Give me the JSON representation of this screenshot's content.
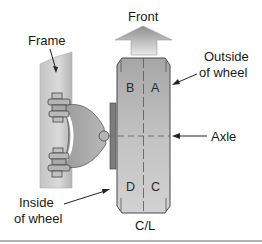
{
  "labels": {
    "frame": "Frame",
    "front": "Front",
    "outside_line1": "Outside",
    "outside_line2": "of wheel",
    "axle": "Axle",
    "inside_line1": "Inside",
    "inside_line2": "of wheel",
    "centerline": "C/L"
  },
  "tire_quadrants": {
    "top_left": "B",
    "top_right": "A",
    "bottom_left": "D",
    "bottom_right": "C"
  },
  "colors": {
    "frame_light": "#d6d6d6",
    "frame_dark": "#a9a9a9",
    "tire_light": "#c8c8c8",
    "tire_dark": "#9e9e9e",
    "outline": "#4a4a4a",
    "text": "#1a1a1a",
    "rule": "#9a9a9a"
  }
}
